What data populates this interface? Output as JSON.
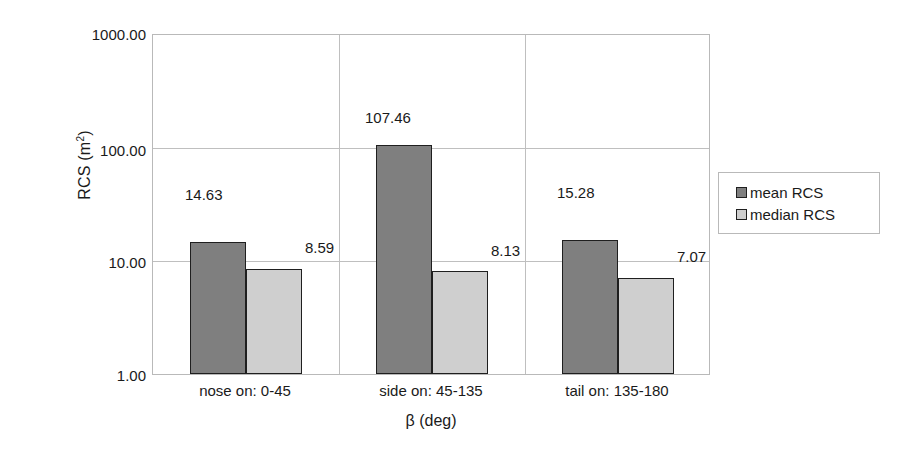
{
  "chart_data": {
    "type": "bar",
    "title": "",
    "subtitle": "",
    "xlabel": "β (deg)",
    "ylabel": "RCS (m²)",
    "ylabel_base": "RCS (m",
    "ylabel_exp": "2",
    "ylabel_close": ")",
    "yscale": "log",
    "ylim": [
      1.0,
      1000.0
    ],
    "ytick_labels": [
      "1000.00",
      "100.00",
      "10.00",
      "1.00"
    ],
    "ytick_values": [
      1000.0,
      100.0,
      10.0,
      1.0
    ],
    "grid": "horizontal-and-category-separators",
    "legend_position": "right-outside",
    "categories": [
      "nose on:  0-45",
      "side on: 45-135",
      "tail on: 135-180"
    ],
    "series": [
      {
        "name": "mean RCS",
        "color": "#7f7f7f",
        "values": [
          14.63,
          107.46,
          15.28
        ],
        "value_labels": [
          "14.63",
          "107.46",
          "15.28"
        ]
      },
      {
        "name": "median RCS",
        "color": "#cfcfcf",
        "values": [
          8.59,
          8.13,
          7.07
        ],
        "value_labels": [
          "8.59",
          "8.13",
          "7.07"
        ]
      }
    ],
    "legend_entries": [
      {
        "label": "mean RCS",
        "swatch": "#7f7f7f"
      },
      {
        "label": "median RCS",
        "swatch": "#cfcfcf"
      }
    ],
    "axis_colors": {
      "frame": "#b9b9b9",
      "grid": "#bfbfbf",
      "bar_outline": "#1f1f1f"
    }
  }
}
